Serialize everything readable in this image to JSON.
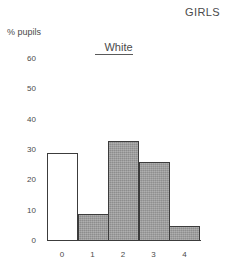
{
  "chart_data": {
    "type": "bar",
    "title": "GIRLS",
    "subtitle": "White",
    "xlabel": "",
    "ylabel": "% pupils",
    "categories": [
      "0",
      "1",
      "2",
      "3",
      "4"
    ],
    "values": [
      29,
      9,
      33,
      26,
      5
    ],
    "bar_styles": [
      "unfilled",
      "filled",
      "filled",
      "filled",
      "filled"
    ],
    "ylim": [
      0,
      60
    ],
    "yticks": [
      0,
      10,
      20,
      30,
      40,
      50,
      60
    ],
    "ytick_labels": [
      "0",
      "10",
      "20",
      "30",
      "40",
      "50",
      "60"
    ],
    "xtick_labels": [
      "0",
      "1",
      "2",
      "3",
      "4"
    ],
    "grid": false,
    "legend": false,
    "colors": {
      "bar_fill": "#9c9c9c",
      "bar_unfilled": "#ffffff",
      "bar_outline": "#3c3c3c",
      "text": "#4a4a4a",
      "background": "#ffffff"
    }
  }
}
